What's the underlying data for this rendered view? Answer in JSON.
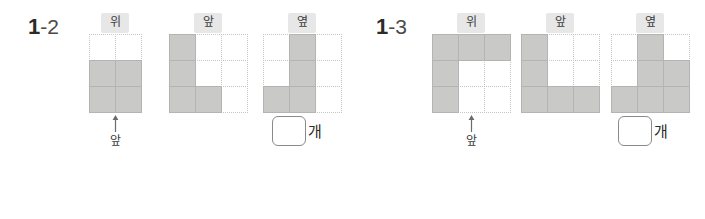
{
  "page": {
    "background_color": "#ffffff",
    "fill_color": "#c9c9c7",
    "grid_line_color": "#c5c5c5",
    "label_chip_color": "#e7e7e7"
  },
  "problems": [
    {
      "number_major": "1",
      "number_minor": "-2",
      "front_marker": {
        "arrow_icon": "arrow-up-icon",
        "label": "앞"
      },
      "answer": {
        "value": "",
        "unit": "개"
      },
      "views": [
        {
          "label": "위",
          "cols": 2,
          "rows": 3,
          "cells": [
            [
              0,
              0
            ],
            [
              1,
              1
            ],
            [
              1,
              1
            ]
          ]
        },
        {
          "label": "앞",
          "cols": 3,
          "rows": 3,
          "cells": [
            [
              1,
              0,
              0
            ],
            [
              1,
              0,
              0
            ],
            [
              1,
              1,
              0
            ]
          ]
        },
        {
          "label": "옆",
          "cols": 3,
          "rows": 3,
          "cells": [
            [
              0,
              1,
              0
            ],
            [
              0,
              1,
              0
            ],
            [
              1,
              1,
              0
            ]
          ]
        }
      ]
    },
    {
      "number_major": "1",
      "number_minor": "-3",
      "front_marker": {
        "arrow_icon": "arrow-up-icon",
        "label": "앞"
      },
      "answer": {
        "value": "",
        "unit": "개"
      },
      "views": [
        {
          "label": "위",
          "cols": 3,
          "rows": 3,
          "cells": [
            [
              1,
              1,
              1
            ],
            [
              1,
              0,
              0
            ],
            [
              1,
              0,
              0
            ]
          ]
        },
        {
          "label": "앞",
          "cols": 3,
          "rows": 3,
          "cells": [
            [
              1,
              0,
              0
            ],
            [
              1,
              0,
              0
            ],
            [
              1,
              1,
              1
            ]
          ]
        },
        {
          "label": "옆",
          "cols": 3,
          "rows": 3,
          "cells": [
            [
              0,
              1,
              0
            ],
            [
              0,
              1,
              1
            ],
            [
              1,
              1,
              1
            ]
          ]
        }
      ]
    }
  ]
}
